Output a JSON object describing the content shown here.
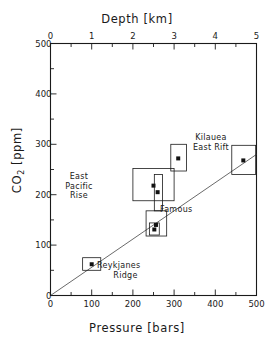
{
  "chart_data": {
    "type": "scatter",
    "title": "",
    "xlabel": "Pressure [bars]",
    "ylabel": "CO2 [ppm]",
    "secondary_xlabel": "Depth [km]",
    "xlim": [
      0,
      500
    ],
    "ylim": [
      0,
      500
    ],
    "secondary_xlim": [
      0,
      5
    ],
    "xticks": [
      0,
      100,
      200,
      300,
      400,
      500
    ],
    "xtick_labels": [
      "0",
      "100",
      "200",
      "300",
      "400",
      "500"
    ],
    "yticks": [
      0,
      100,
      200,
      300,
      400,
      500
    ],
    "ytick_labels": [
      "0",
      "100",
      "200",
      "300",
      "400",
      "500"
    ],
    "secondary_xticks": [
      0,
      1,
      2,
      3,
      4,
      5
    ],
    "secondary_xtick_labels": [
      "0",
      "1",
      "2",
      "3",
      "4",
      "5"
    ],
    "minor_tick_subdivisions": 2,
    "grid": false,
    "legend": "none",
    "trend_line": {
      "label": "solubility trend",
      "x0": 0,
      "y0": 0,
      "x1": 500,
      "y1": 280
    },
    "points": [
      {
        "label": "East Pacific Rise",
        "x": 250,
        "y": 218,
        "xerr_low": 200,
        "xerr_high": 300,
        "yerr_low": 188,
        "yerr_high": 252,
        "label_position": "left"
      },
      {
        "label": "Kilauea East Rift",
        "x": 310,
        "y": 272,
        "xerr_low": 292,
        "xerr_high": 330,
        "yerr_low": 247,
        "yerr_high": 300,
        "label_position": "right"
      },
      {
        "label": "Famous",
        "x": 260,
        "y": 205,
        "xerr_low": 252,
        "xerr_high": 272,
        "yerr_low": 168,
        "yerr_high": 240,
        "label_position": "right"
      },
      {
        "label": "",
        "x": 256,
        "y": 140,
        "xerr_low": 232,
        "xerr_high": 282,
        "yerr_low": 118,
        "yerr_high": 168,
        "label_position": "none"
      },
      {
        "label": "",
        "x": 252,
        "y": 131,
        "xerr_low": 240,
        "xerr_high": 264,
        "yerr_low": 120,
        "yerr_high": 144,
        "label_position": "none"
      },
      {
        "label": "Reykjanes Ridge",
        "x": 100,
        "y": 62,
        "xerr_low": 78,
        "xerr_high": 122,
        "yerr_low": 50,
        "yerr_high": 75,
        "label_position": "right"
      },
      {
        "label": "",
        "x": 468,
        "y": 268,
        "xerr_low": 440,
        "xerr_high": 498,
        "yerr_low": 240,
        "yerr_high": 298,
        "label_position": "none"
      }
    ],
    "annotations": [
      {
        "text": "East",
        "ref": "East Pacific Rise"
      },
      {
        "text": "Pacific",
        "ref": "East Pacific Rise"
      },
      {
        "text": "Rise",
        "ref": "East Pacific Rise"
      },
      {
        "text": "Kilauea",
        "ref": "Kilauea East Rift"
      },
      {
        "text": "East  Rift",
        "ref": "Kilauea East Rift"
      },
      {
        "text": "Famous",
        "ref": "Famous"
      },
      {
        "text": "Reykjanes",
        "ref": "Reykjanes Ridge"
      },
      {
        "text": "Ridge",
        "ref": "Reykjanes Ridge"
      }
    ]
  },
  "axes": {
    "depth_title": "Depth [km]",
    "pressure_title": "Pressure [bars]",
    "co2_title_main": "CO",
    "co2_title_sub": "2",
    "co2_title_unit": " [ppm]"
  },
  "labels": {
    "epr_line1": "East",
    "epr_line2": "Pacific",
    "epr_line3": "Rise",
    "kilauea_line1": "Kilauea",
    "kilauea_line2": "East  Rift",
    "famous": "Famous",
    "reykjanes_line1": "Reykjanes",
    "reykjanes_line2": "Ridge"
  },
  "ticks": {
    "x": [
      "0",
      "100",
      "200",
      "300",
      "400",
      "500"
    ],
    "y": [
      "0",
      "100",
      "200",
      "300",
      "400",
      "500"
    ],
    "depth": [
      "0",
      "1",
      "2",
      "3",
      "4",
      "5"
    ]
  }
}
